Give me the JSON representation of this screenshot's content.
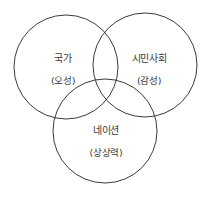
{
  "diagram": {
    "type": "venn",
    "stroke_color": "#3a3a3a",
    "background": "#ffffff",
    "circles": [
      {
        "id": "state",
        "title": "국가",
        "subtitle": "(오성)",
        "cx": 66,
        "cy": 67,
        "r": 52,
        "title_pos": [
          63,
          57
        ],
        "subtitle_pos": [
          63,
          80
        ]
      },
      {
        "id": "civil-society",
        "title": "시민사회",
        "subtitle": "(감성)",
        "cx": 145,
        "cy": 65,
        "r": 52,
        "title_pos": [
          149,
          57
        ],
        "subtitle_pos": [
          149,
          80
        ]
      },
      {
        "id": "nation",
        "title": "네이션",
        "subtitle": "(상상력)",
        "cx": 105,
        "cy": 131,
        "r": 52,
        "title_pos": [
          106,
          129
        ],
        "subtitle_pos": [
          106,
          152
        ]
      }
    ]
  }
}
